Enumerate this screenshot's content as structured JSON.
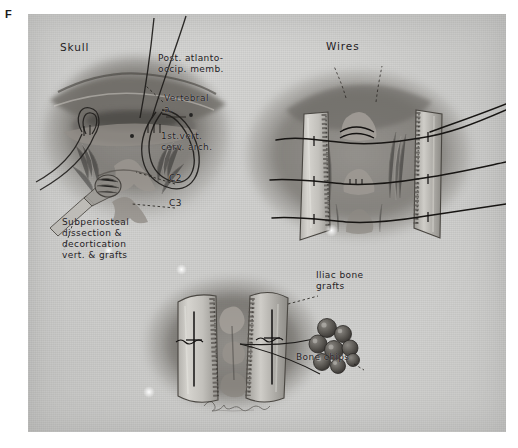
{
  "figure": {
    "letter": "F",
    "caption_labels": []
  },
  "plate": {
    "medium": "airbrush and pencil medical illustration",
    "background_color": "#cbcbc9",
    "ink_color": "#23201e"
  },
  "panels": [
    {
      "id": "upper-left",
      "name": "exposure-and-wire-passage",
      "labels": [
        {
          "key": "skull",
          "text": "Skull"
        },
        {
          "key": "post_atlanto",
          "text": "Post. atlanto-\noccip. memb."
        },
        {
          "key": "vertebral_a",
          "text": "Vertebral\n     a."
        },
        {
          "key": "first_cerv_arch",
          "text": "1st.vert.\ncerv. arch."
        },
        {
          "key": "c2",
          "text": "C2"
        },
        {
          "key": "c3",
          "text": "C3"
        },
        {
          "key": "subperiosteal",
          "text": "Subperiosteal\ndissection &\ndecortication\nvert. & grafts"
        }
      ]
    },
    {
      "id": "upper-right",
      "name": "grafts-wired-in-place",
      "labels": [
        {
          "key": "wires",
          "text": "Wires"
        }
      ]
    },
    {
      "id": "lower-center",
      "name": "iliac-grafts-and-chips",
      "labels": [
        {
          "key": "iliac_grafts",
          "text": "Iliac bone\n  grafts"
        },
        {
          "key": "bone_chips",
          "text": "Bone chips"
        }
      ]
    }
  ],
  "signature": {
    "name": "artist-signature",
    "legible": false,
    "text": ""
  }
}
